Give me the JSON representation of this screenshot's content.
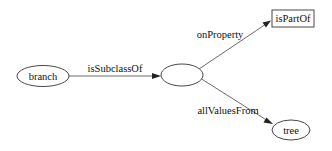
{
  "diagram": {
    "type": "graph",
    "nodes": [
      {
        "id": "branch",
        "label": "branch",
        "shape": "ellipse"
      },
      {
        "id": "blank",
        "label": "",
        "shape": "ellipse"
      },
      {
        "id": "isPartOf",
        "label": "isPartOf",
        "shape": "box"
      },
      {
        "id": "tree",
        "label": "tree",
        "shape": "ellipse"
      }
    ],
    "edges": [
      {
        "from": "branch",
        "to": "blank",
        "label": "isSubclassOf"
      },
      {
        "from": "blank",
        "to": "isPartOf",
        "label": "onProperty"
      },
      {
        "from": "blank",
        "to": "tree",
        "label": "allValuesFrom"
      }
    ]
  },
  "labels": {
    "branch": "branch",
    "isPartOf": "isPartOf",
    "tree": "tree",
    "isSubclassOf": "isSubclassOf",
    "onProperty": "onProperty",
    "allValuesFrom": "allValuesFrom"
  }
}
